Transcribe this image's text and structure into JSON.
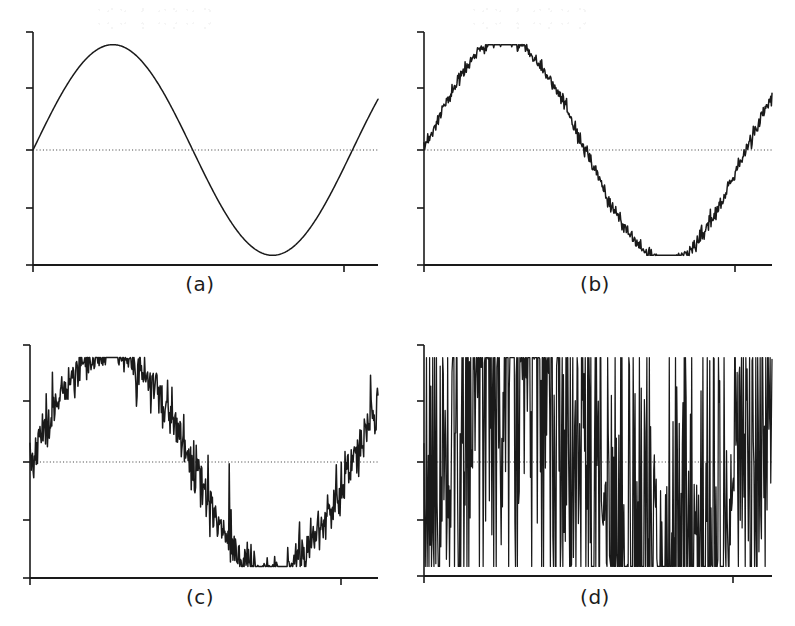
{
  "figure": {
    "background_color": "#ffffff",
    "ink_color": "#1a1a1a",
    "zero_line_color": "#4a4a4a",
    "axis_color": "#1a1a1a",
    "panel_count": 4,
    "layout": "2x2 grid"
  },
  "panels": [
    {
      "id": "a",
      "caption": "(a)",
      "description": "clean sine wave, no noise",
      "noise_amplitude": 0.0,
      "snr_label": "",
      "axis": {
        "x_start_px": 33,
        "x_end_px": 378,
        "baseline_px": 265,
        "top_px": 32,
        "zero_px": 150,
        "y_ticks_px": [
          32,
          88,
          150,
          208,
          265
        ],
        "x_ticks_px": [
          33,
          344
        ],
        "tick_length_px": 7
      },
      "chart_data": {
        "type": "line",
        "title": "(a)",
        "xlabel": "",
        "ylabel": "",
        "xlim": [
          0,
          1.08
        ],
        "ylim": [
          -1.12,
          1.12
        ],
        "grid": false,
        "legend": "none",
        "zero_line": true,
        "signal": {
          "waveform": "sine",
          "amplitude": 1.0,
          "cycles": 1.0,
          "phase": 0.0,
          "clip": 1.0
        },
        "noise": {
          "type": "none",
          "amplitude": 0.0,
          "spikiness": 0.0
        },
        "seed": 11,
        "samples": 560
      }
    },
    {
      "id": "b",
      "caption": "(b)",
      "description": "sine wave with low-level noise, peaks lightly clipped",
      "noise_amplitude": 0.035,
      "snr_label": "",
      "axis": {
        "x_start_px": 424,
        "x_end_px": 772,
        "baseline_px": 265,
        "top_px": 32,
        "zero_px": 150,
        "y_ticks_px": [
          32,
          88,
          150,
          208,
          265
        ],
        "x_ticks_px": [
          424,
          735
        ],
        "tick_length_px": 7
      },
      "chart_data": {
        "type": "line",
        "title": "(b)",
        "xlabel": "",
        "ylabel": "",
        "xlim": [
          0,
          1.08
        ],
        "ylim": [
          -1.12,
          1.12
        ],
        "grid": false,
        "legend": "none",
        "zero_line": true,
        "signal": {
          "waveform": "sine",
          "amplitude": 1.06,
          "cycles": 1.0,
          "phase": 0.0,
          "clip": 1.0
        },
        "noise": {
          "type": "gaussian",
          "amplitude": 0.035,
          "spikiness": 0.0
        },
        "seed": 23,
        "samples": 560
      }
    },
    {
      "id": "c",
      "caption": "(c)",
      "description": "sine wave with moderate noise",
      "noise_amplitude": 0.11,
      "snr_label": "",
      "axis": {
        "x_start_px": 30,
        "x_end_px": 378,
        "baseline_px": 578,
        "top_px": 345,
        "zero_px": 462,
        "y_ticks_px": [
          345,
          401,
          462,
          520,
          578
        ],
        "x_ticks_px": [
          30,
          341
        ],
        "tick_length_px": 7
      },
      "chart_data": {
        "type": "line",
        "title": "(c)",
        "xlabel": "",
        "ylabel": "",
        "xlim": [
          0,
          1.08
        ],
        "ylim": [
          -1.12,
          1.12
        ],
        "grid": false,
        "legend": "none",
        "zero_line": true,
        "signal": {
          "waveform": "sine",
          "amplitude": 1.08,
          "cycles": 1.0,
          "phase": 0.0,
          "clip": 1.0
        },
        "noise": {
          "type": "gaussian",
          "amplitude": 0.11,
          "spikiness": 0.18
        },
        "seed": 37,
        "samples": 560
      }
    },
    {
      "id": "d",
      "caption": "(d)",
      "description": "sine wave buried in heavy noise, signal visible only at the clipped crest and trough",
      "noise_amplitude": 0.95,
      "snr_label": "",
      "axis": {
        "x_start_px": 424,
        "x_end_px": 772,
        "baseline_px": 576,
        "top_px": 345,
        "zero_px": 462,
        "y_ticks_px": [
          345,
          401,
          462,
          520,
          576
        ],
        "x_ticks_px": [
          424,
          733
        ],
        "tick_length_px": 7
      },
      "chart_data": {
        "type": "line",
        "title": "(d)",
        "xlabel": "",
        "ylabel": "",
        "xlim": [
          0,
          1.08
        ],
        "ylim": [
          -1.12,
          1.12
        ],
        "grid": false,
        "legend": "none",
        "zero_line": true,
        "signal": {
          "waveform": "sine",
          "amplitude": 1.1,
          "cycles": 1.0,
          "phase": 0.0,
          "clip": 1.0
        },
        "noise": {
          "type": "gaussian",
          "amplitude": 0.95,
          "spikiness": 0.9
        },
        "seed": 101,
        "samples": 560
      }
    }
  ]
}
